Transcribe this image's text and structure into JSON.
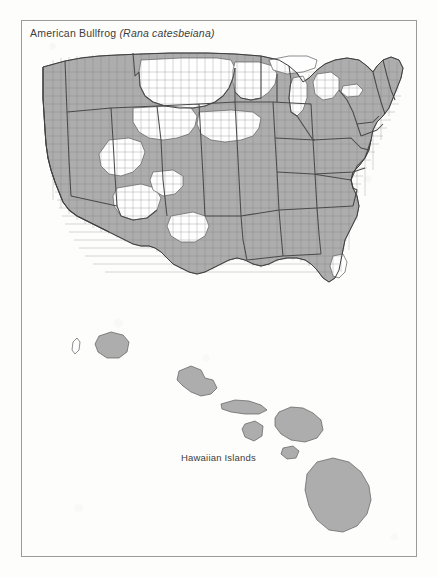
{
  "page": {
    "background_color": "#fdfdfc",
    "frame_color": "#9b9b9b"
  },
  "map": {
    "title_common_name": "American Bullfrog",
    "title_scientific_name": "(Rana catesbeiana)",
    "inset_label": "Hawaiian Islands",
    "shaded_fill_color": "#adadad",
    "unshaded_fill_color": "#fefefe",
    "county_line_color": "#7e7e7e",
    "state_line_color": "#4a4a4a"
  },
  "regions": {
    "mainland": {
      "name": "Contiguous United States",
      "unit_level": "county",
      "presence_notes": "Shaded counties indicate recorded occurrence; eastern and central states almost fully shaded, northern Great Plains and parts of the Great Basin largely unshaded."
    },
    "hawaii": {
      "name": "Hawaiian Islands",
      "islands": [
        {
          "name": "Niihau",
          "shaded": false
        },
        {
          "name": "Kauai",
          "shaded": true
        },
        {
          "name": "Oahu",
          "shaded": true
        },
        {
          "name": "Molokai",
          "shaded": true
        },
        {
          "name": "Lanai",
          "shaded": true
        },
        {
          "name": "Maui",
          "shaded": true
        },
        {
          "name": "Kahoolawe",
          "shaded": true
        },
        {
          "name": "Hawaii",
          "shaded": true
        }
      ]
    }
  }
}
